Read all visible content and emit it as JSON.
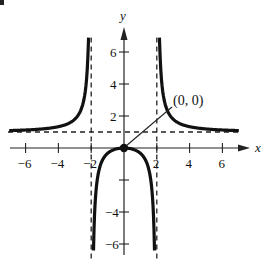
{
  "chart_data": {
    "type": "line",
    "title": "",
    "function": "y = x^2 / (x^2 - 4)",
    "xlabel": "x",
    "ylabel": "y",
    "xlim": [
      -7,
      7
    ],
    "ylim": [
      -7,
      7
    ],
    "x_ticks": [
      -6,
      -4,
      -2,
      2,
      4,
      6
    ],
    "x_tick_labels": [
      "−6",
      "−4",
      "−2",
      "2",
      "4",
      "6"
    ],
    "y_ticks": [
      -6,
      -4,
      -2,
      2,
      4,
      6
    ],
    "y_tick_labels": [
      "−6",
      "−4",
      "",
      "2",
      "4",
      "6"
    ],
    "grid": false,
    "asymptotes": {
      "vertical": [
        -2,
        2
      ],
      "horizontal": [
        1
      ],
      "style": "dashed"
    },
    "series": [
      {
        "name": "left branch",
        "x": [
          -7,
          -6,
          -5,
          -4,
          -3,
          -2.5,
          -2.2
        ],
        "y": [
          1.09,
          1.13,
          1.19,
          1.33,
          1.8,
          2.78,
          5.76
        ]
      },
      {
        "name": "middle branch",
        "x": [
          -1.8,
          -1.5,
          -1,
          -0.5,
          0,
          0.5,
          1,
          1.5,
          1.8
        ],
        "y": [
          -4.26,
          -1.29,
          -0.33,
          -0.07,
          0,
          -0.07,
          -0.33,
          -1.29,
          -4.26
        ]
      },
      {
        "name": "right branch",
        "x": [
          2.2,
          2.5,
          3,
          4,
          5,
          6,
          7
        ],
        "y": [
          5.76,
          2.78,
          1.8,
          1.33,
          1.19,
          1.13,
          1.09
        ]
      }
    ],
    "points": [
      {
        "x": 0,
        "y": 0,
        "label": "(0, 0)"
      }
    ],
    "annotations": [
      {
        "text": "(0, 0)",
        "points_to": [
          0,
          0
        ]
      }
    ]
  },
  "labels": {
    "x_axis": "x",
    "y_axis": "y",
    "point_label": "(0, 0)",
    "x_ticks": [
      "−6",
      "−4",
      "−2",
      "2",
      "4",
      "6"
    ],
    "y_ticks": [
      "6",
      "4",
      "2",
      "−4",
      "−6"
    ]
  }
}
